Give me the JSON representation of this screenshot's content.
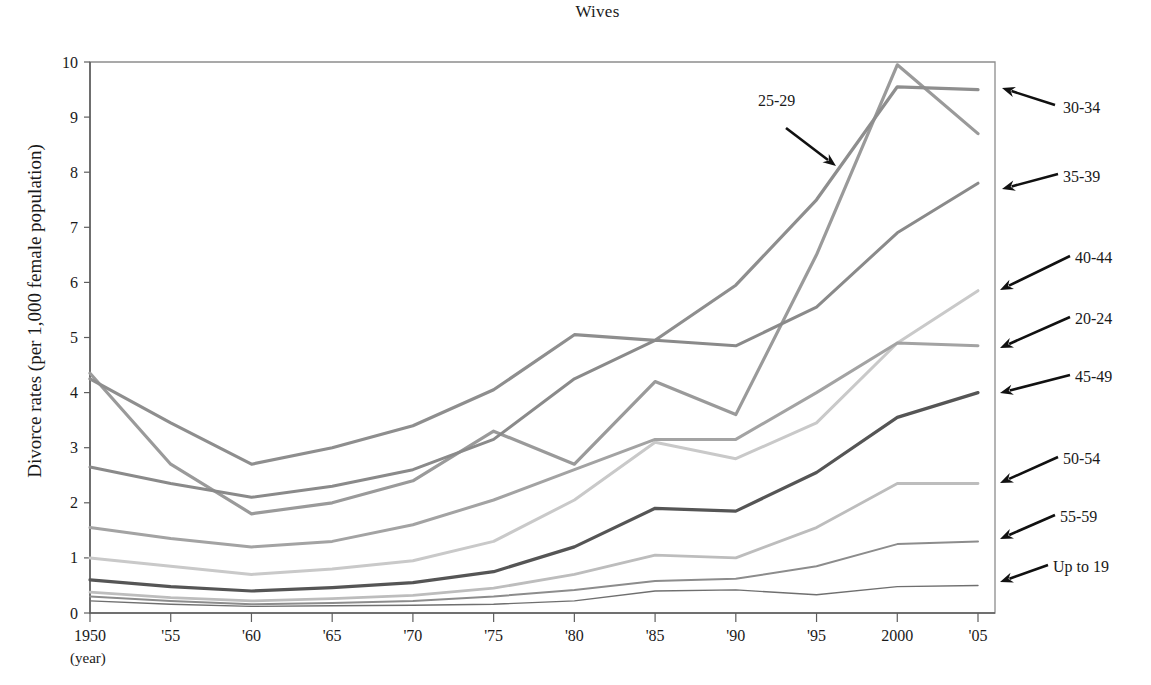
{
  "title": "Wives",
  "axis": {
    "ylabel": "Divorce rates (per 1,000 female population)",
    "xlabel": "(year)",
    "yticks": [
      "0",
      "1",
      "2",
      "3",
      "4",
      "5",
      "6",
      "7",
      "8",
      "9",
      "10"
    ],
    "xticks": [
      "1950",
      "'55",
      "'60",
      "'65",
      "'70",
      "'75",
      "'80",
      "'85",
      "'90",
      "'95",
      "2000",
      "'05"
    ]
  },
  "annotations": [
    {
      "id": "ann-25-29",
      "label": "25-29"
    },
    {
      "id": "ann-30-34",
      "label": "30-34"
    },
    {
      "id": "ann-35-39",
      "label": "35-39"
    },
    {
      "id": "ann-40-44",
      "label": "40-44"
    },
    {
      "id": "ann-20-24",
      "label": "20-24"
    },
    {
      "id": "ann-45-49",
      "label": "45-49"
    },
    {
      "id": "ann-50-54",
      "label": "50-54"
    },
    {
      "id": "ann-55-59",
      "label": "55-59"
    },
    {
      "id": "ann-up-to-19",
      "label": "Up to 19"
    }
  ],
  "chart_data": {
    "type": "line",
    "title": "Wives",
    "xlabel": "(year)",
    "ylabel": "Divorce rates (per 1,000 female population)",
    "x": [
      1950,
      1955,
      1960,
      1965,
      1970,
      1975,
      1980,
      1985,
      1990,
      1995,
      2000,
      2005
    ],
    "xtick_labels": [
      "1950",
      "'55",
      "'60",
      "'65",
      "'70",
      "'75",
      "'80",
      "'85",
      "'90",
      "'95",
      "2000",
      "'05"
    ],
    "ylim": [
      0,
      10
    ],
    "xlim": [
      1950,
      2005
    ],
    "ytick_step": 1,
    "grid": false,
    "legend_position": "right-annotations-with-arrows",
    "series": [
      {
        "name": "25-29",
        "color": "#9a9a9a",
        "values": [
          4.35,
          2.7,
          1.8,
          2.0,
          2.4,
          3.3,
          2.7,
          4.2,
          3.6,
          6.5,
          9.95,
          8.7
        ]
      },
      {
        "name": "30-34",
        "color": "#8e8e8e",
        "values": [
          4.25,
          3.45,
          2.7,
          3.0,
          3.4,
          4.05,
          5.05,
          4.95,
          5.95,
          7.5,
          9.55,
          9.5
        ]
      },
      {
        "name": "35-39",
        "color": "#8a8a8a",
        "values": [
          2.65,
          2.35,
          2.1,
          2.3,
          2.6,
          3.15,
          4.25,
          4.95,
          4.85,
          5.55,
          6.9,
          7.8
        ]
      },
      {
        "name": "40-44",
        "color": "#c9c9c9",
        "values": [
          1.0,
          0.85,
          0.7,
          0.8,
          0.95,
          1.3,
          2.05,
          3.1,
          2.8,
          3.45,
          4.9,
          5.85
        ]
      },
      {
        "name": "20-24",
        "color": "#a3a3a3",
        "values": [
          1.55,
          1.35,
          1.2,
          1.3,
          1.6,
          2.05,
          2.6,
          3.15,
          3.15,
          4.0,
          4.9,
          4.85
        ]
      },
      {
        "name": "45-49",
        "color": "#555555",
        "values": [
          0.6,
          0.48,
          0.4,
          0.46,
          0.55,
          0.75,
          1.2,
          1.9,
          1.85,
          2.55,
          3.55,
          4.0
        ]
      },
      {
        "name": "50-54",
        "color": "#bdbdbd",
        "values": [
          0.38,
          0.28,
          0.22,
          0.26,
          0.32,
          0.45,
          0.7,
          1.05,
          1.0,
          1.55,
          2.35,
          2.35
        ]
      },
      {
        "name": "55-59",
        "color": "#8c8c8c",
        "values": [
          0.3,
          0.22,
          0.16,
          0.18,
          0.22,
          0.3,
          0.42,
          0.58,
          0.62,
          0.85,
          1.25,
          1.3
        ]
      },
      {
        "name": "Up to 19",
        "color": "#6f6f6f",
        "values": [
          0.22,
          0.16,
          0.12,
          0.13,
          0.14,
          0.16,
          0.22,
          0.4,
          0.42,
          0.33,
          0.48,
          0.5
        ]
      }
    ]
  },
  "geometry": {
    "plot": {
      "left": 90,
      "right": 995,
      "top": 62,
      "bottom": 613
    },
    "x_first_tick": 90,
    "x_last_tick": 978
  }
}
